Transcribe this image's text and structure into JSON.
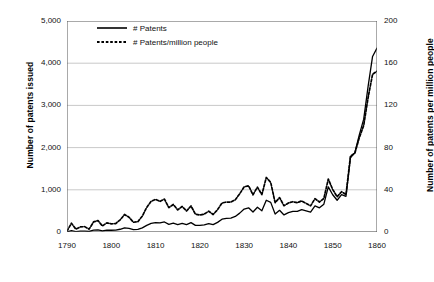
{
  "chart_data": {
    "type": "line",
    "title": "",
    "xlabel": "",
    "ylabel": "Number of patents issued",
    "ylabel_secondary": "Number of patents per million people",
    "xlim": [
      1790,
      1860
    ],
    "ylim": [
      0,
      5000
    ],
    "ylim_secondary": [
      0,
      200
    ],
    "grid": true,
    "legend_position": "top-left",
    "xticks": [
      "1790",
      "1800",
      "1810",
      "1820",
      "1830",
      "1840",
      "1850",
      "1860"
    ],
    "xtick_values": [
      1790,
      1800,
      1810,
      1820,
      1830,
      1840,
      1850,
      1860
    ],
    "yticks": [
      "0",
      "1,000",
      "2,000",
      "3,000",
      "4,000",
      "5,000"
    ],
    "ytick_values": [
      0,
      1000,
      2000,
      3000,
      4000,
      5000
    ],
    "yticks_secondary": [
      "0",
      "40",
      "80",
      "120",
      "160",
      "200"
    ],
    "ytick_values_secondary": [
      0,
      40,
      80,
      120,
      160,
      200
    ],
    "x": [
      1790,
      1791,
      1792,
      1793,
      1794,
      1795,
      1796,
      1797,
      1798,
      1799,
      1800,
      1801,
      1802,
      1803,
      1804,
      1805,
      1806,
      1807,
      1808,
      1809,
      1810,
      1811,
      1812,
      1813,
      1814,
      1815,
      1816,
      1817,
      1818,
      1819,
      1820,
      1821,
      1822,
      1823,
      1824,
      1825,
      1826,
      1827,
      1828,
      1829,
      1830,
      1831,
      1832,
      1833,
      1834,
      1835,
      1836,
      1837,
      1838,
      1839,
      1840,
      1841,
      1842,
      1843,
      1844,
      1845,
      1846,
      1847,
      1848,
      1849,
      1850,
      1851,
      1852,
      1853,
      1854,
      1855,
      1856,
      1857,
      1858,
      1859,
      1860
    ],
    "series": [
      {
        "name": "# Patents",
        "axis": "left",
        "style": "solid",
        "color": "#000000",
        "values": [
          3,
          33,
          11,
          20,
          22,
          12,
          44,
          51,
          28,
          44,
          41,
          44,
          65,
          97,
          84,
          57,
          63,
          99,
          158,
          203,
          223,
          215,
          238,
          181,
          210,
          173,
          206,
          174,
          222,
          156,
          155,
          168,
          200,
          173,
          228,
          304,
          323,
          331,
          368,
          447,
          544,
          573,
          474,
          586,
          502,
          752,
          702,
          426,
          514,
          404,
          458,
          490,
          488,
          531,
          502,
          473,
          619,
          572,
          660,
          1070,
          883,
          752,
          885,
          846,
          1755,
          1881,
          2302,
          2674,
          3455,
          4160,
          4357
        ]
      },
      {
        "name": "# Patents/million people",
        "axis": "right",
        "style": "dotted",
        "color": "#000000",
        "values": [
          0.8,
          8.3,
          2.7,
          4.8,
          5.1,
          2.7,
          9.6,
          10.8,
          5.7,
          8.7,
          7.7,
          8.0,
          11.5,
          16.6,
          14.0,
          9.2,
          9.8,
          15.0,
          23.3,
          29.1,
          30.9,
          29.0,
          31.2,
          23.1,
          26.1,
          20.9,
          24.2,
          19.9,
          24.7,
          16.9,
          16.1,
          17.0,
          19.7,
          16.6,
          21.2,
          27.5,
          28.4,
          28.3,
          30.6,
          36.2,
          42.8,
          43.8,
          35.3,
          42.5,
          35.4,
          51.7,
          47.0,
          27.8,
          32.6,
          24.9,
          27.5,
          28.7,
          27.8,
          29.5,
          27.1,
          24.8,
          31.6,
          28.4,
          31.8,
          50.2,
          40.3,
          33.4,
          38.2,
          35.5,
          71.7,
          74.8,
          89.3,
          101.1,
          127.6,
          149.5,
          152.4
        ]
      }
    ]
  },
  "legend": {
    "entries": [
      {
        "label": "# Patents",
        "style": "solid"
      },
      {
        "label": "# Patents/million people",
        "style": "dotted"
      }
    ]
  }
}
